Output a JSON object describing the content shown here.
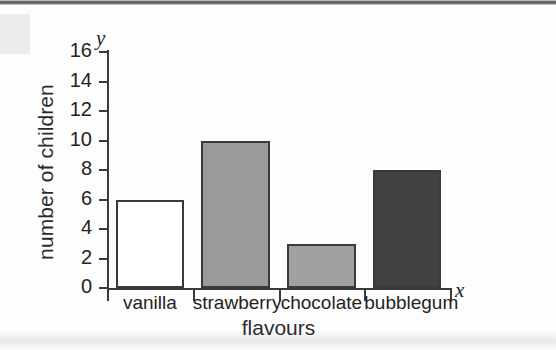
{
  "chart_data": {
    "type": "bar",
    "title": "",
    "categories": [
      "vanilla",
      "strawberry",
      "chocolate",
      "bubblegum"
    ],
    "values": [
      6,
      10,
      3,
      8
    ],
    "xlabel": "flavours",
    "ylabel": "number of children",
    "x_axis_symbol": "x",
    "y_axis_symbol": "y",
    "ylim": [
      0,
      16
    ],
    "ytick_step": 2,
    "yticks": [
      0,
      2,
      4,
      6,
      8,
      10,
      12,
      14,
      16
    ],
    "ytick_labels": [
      "0",
      "2",
      "4",
      "6",
      "8",
      "10",
      "12",
      "14",
      "16"
    ],
    "grid": false,
    "legend": null,
    "bar_colors": [
      "#ffffff",
      "#9a9a9a",
      "#a0a0a0",
      "#414141"
    ],
    "bar_edge_color": "#3a3a3a",
    "axis_color": "#3a3a3a",
    "text_color": "#232323",
    "background": "#fdfdfd"
  }
}
